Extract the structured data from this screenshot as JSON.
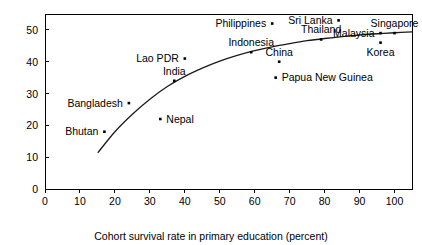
{
  "chart_data": {
    "type": "scatter",
    "title": "",
    "xlabel": "Cohort survival rate in primary education (percent)",
    "ylabel": "",
    "xlim": [
      0,
      105
    ],
    "ylim": [
      0,
      55
    ],
    "xticks": [
      0,
      10,
      20,
      30,
      40,
      50,
      60,
      70,
      80,
      90,
      100
    ],
    "yticks": [
      0,
      10,
      20,
      30,
      40,
      50
    ],
    "grid": false,
    "legend": "none",
    "points": [
      {
        "label": "Bhutan",
        "x": 17,
        "y": 18,
        "label_pos": "left"
      },
      {
        "label": "Bangladesh",
        "x": 24,
        "y": 27,
        "label_pos": "left"
      },
      {
        "label": "Nepal",
        "x": 33,
        "y": 22,
        "label_pos": "right"
      },
      {
        "label": "India",
        "x": 37,
        "y": 34,
        "label_pos": "above"
      },
      {
        "label": "Lao PDR",
        "x": 40,
        "y": 41,
        "label_pos": "left"
      },
      {
        "label": "Indonesia",
        "x": 59,
        "y": 43,
        "label_pos": "above"
      },
      {
        "label": "Philippines",
        "x": 65,
        "y": 52,
        "label_pos": "left"
      },
      {
        "label": "China",
        "x": 67,
        "y": 40,
        "label_pos": "above"
      },
      {
        "label": "Papua New Guinea",
        "x": 66,
        "y": 35,
        "label_pos": "right"
      },
      {
        "label": "Thailand",
        "x": 79,
        "y": 47,
        "label_pos": "above"
      },
      {
        "label": "Sri Lanka",
        "x": 84,
        "y": 53,
        "label_pos": "left"
      },
      {
        "label": "Malaysia",
        "x": 96,
        "y": 49,
        "label_pos": "left"
      },
      {
        "label": "Korea",
        "x": 96,
        "y": 46,
        "label_pos": "below"
      },
      {
        "label": "Singapore",
        "x": 100,
        "y": 49,
        "label_pos": "above"
      }
    ],
    "curve": {
      "name": "fitted-trend",
      "points": [
        {
          "x": 15.2,
          "y": 11.5
        },
        {
          "x": 20,
          "y": 18.0
        },
        {
          "x": 25,
          "y": 23.5
        },
        {
          "x": 30,
          "y": 28.2
        },
        {
          "x": 35,
          "y": 32.2
        },
        {
          "x": 40,
          "y": 35.4
        },
        {
          "x": 45,
          "y": 38.0
        },
        {
          "x": 50,
          "y": 40.2
        },
        {
          "x": 55,
          "y": 42.0
        },
        {
          "x": 60,
          "y": 43.5
        },
        {
          "x": 65,
          "y": 44.7
        },
        {
          "x": 70,
          "y": 45.7
        },
        {
          "x": 75,
          "y": 46.6
        },
        {
          "x": 80,
          "y": 47.3
        },
        {
          "x": 85,
          "y": 47.9
        },
        {
          "x": 90,
          "y": 48.4
        },
        {
          "x": 95,
          "y": 48.8
        },
        {
          "x": 100,
          "y": 49.1
        },
        {
          "x": 105,
          "y": 49.4
        }
      ]
    }
  },
  "colors": {
    "axis": "#000000",
    "marker": "#000000",
    "curve": "#1a1a1a",
    "background": "#ffffff"
  }
}
